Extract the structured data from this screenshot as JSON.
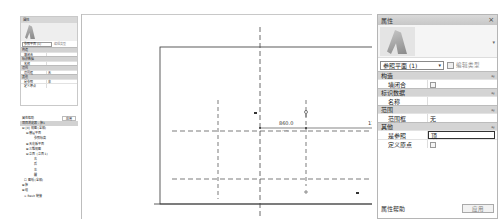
{
  "mini_properties": {
    "title": "属性",
    "type_selector": "参照平面 (1)",
    "edit_type": "编辑类型",
    "sections": [
      {
        "label": "构造",
        "rows": [
          {
            "key": "墙闭合",
            "value": ""
          }
        ]
      },
      {
        "label": "标识数据",
        "rows": [
          {
            "key": "名称",
            "value": ""
          }
        ]
      },
      {
        "label": "范围",
        "rows": [
          {
            "key": "范围框",
            "value": "无"
          }
        ]
      },
      {
        "label": "其他",
        "rows": [
          {
            "key": "是参照",
            "value": "非"
          },
          {
            "key": "定义原点",
            "value": ""
          }
        ]
      }
    ]
  },
  "mini_browser": {
    "help_label": "属性帮助",
    "apply_label": "应用",
    "title": "项目浏览器 - 族1",
    "tree": [
      {
        "indent": 0,
        "label": "⊟ [0] 视图 (全部)"
      },
      {
        "indent": 1,
        "label": "⊟ 楼层平面"
      },
      {
        "indent": 3,
        "label": "参照标高"
      },
      {
        "indent": 1,
        "label": "⊞ 天花板平面"
      },
      {
        "indent": 1,
        "label": "⊞ 三维视图"
      },
      {
        "indent": 1,
        "label": "⊟ 立面 (立面 1)"
      },
      {
        "indent": 3,
        "label": "右"
      },
      {
        "indent": 3,
        "label": "后"
      },
      {
        "indent": 3,
        "label": "左"
      },
      {
        "indent": 3,
        "label": "前"
      },
      {
        "indent": 0,
        "label": "☐ 图纸 (全部)"
      },
      {
        "indent": 0,
        "label": "⊞ 族"
      },
      {
        "indent": 0,
        "label": "⊞ 组"
      },
      {
        "indent": 0,
        "label": "∞ Revit 链接"
      }
    ]
  },
  "drawing": {
    "dimension_left": "860.0",
    "dimension_right": "1120.0"
  },
  "properties": {
    "title": "属性",
    "close_icon": "×",
    "type_selector": "参照平面 (1)",
    "edit_type": "编辑类型",
    "sections": [
      {
        "label": "构造",
        "toggle": "≈",
        "rows": [
          {
            "key": "墙闭合",
            "value": "",
            "checkbox": true
          }
        ]
      },
      {
        "label": "标识数据",
        "toggle": "≈",
        "rows": [
          {
            "key": "名称",
            "value": ""
          }
        ]
      },
      {
        "label": "范围",
        "toggle": "≈",
        "rows": [
          {
            "key": "范围框",
            "value": "无"
          }
        ]
      },
      {
        "label": "其他",
        "toggle": "≈",
        "rows": [
          {
            "key": "是参照",
            "value": "顶",
            "editing": true
          },
          {
            "key": "定义原点",
            "value": "",
            "checkbox": true
          }
        ]
      }
    ],
    "help_label": "属性帮助",
    "apply_label": "应用"
  }
}
